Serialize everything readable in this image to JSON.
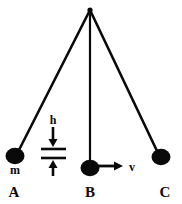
{
  "figure": {
    "background_color": "#ffffff",
    "ink_color": "#0a0a0a",
    "width": 182,
    "height": 204,
    "pivot": {
      "x": 90,
      "y": 10,
      "name": "pivot-point"
    },
    "positions": [
      {
        "id": "A",
        "label": "A",
        "label_x": 14,
        "label_y": 196,
        "bob": {
          "cx": 15,
          "cy": 156,
          "rx": 9,
          "ry": 8
        },
        "string": {
          "x1": 90,
          "y1": 10,
          "x2": 19,
          "y2": 150
        }
      },
      {
        "id": "B",
        "label": "B",
        "label_x": 90,
        "label_y": 196,
        "bob": {
          "cx": 90,
          "cy": 168,
          "rx": 9,
          "ry": 8
        },
        "string": {
          "x1": 90,
          "y1": 10,
          "x2": 90,
          "y2": 163
        }
      },
      {
        "id": "C",
        "label": "C",
        "label_x": 165,
        "label_y": 196,
        "bob": {
          "cx": 161,
          "cy": 157,
          "rx": 9,
          "ry": 8
        },
        "string": {
          "x1": 90,
          "y1": 10,
          "x2": 157,
          "y2": 151
        }
      }
    ],
    "annotations": {
      "mass_label": {
        "text": "m",
        "x": 15,
        "y": 174,
        "name": "mass-label"
      },
      "height_label": {
        "text": "h",
        "x": 53,
        "y": 124,
        "name": "height-label"
      },
      "velocity_label": {
        "text": "v",
        "x": 132,
        "y": 170,
        "name": "velocity-label"
      },
      "height_marker": {
        "name": "height-measure",
        "down_arrow": {
          "x": 53,
          "y1": 128,
          "y2": 146
        },
        "upper_bar": {
          "x1": 41,
          "x2": 66,
          "y": 148
        },
        "lower_bar": {
          "x1": 41,
          "x2": 66,
          "y": 157
        },
        "up_arrow": {
          "x": 53,
          "y1": 175,
          "y2": 157
        }
      },
      "velocity_arrow": {
        "name": "velocity-arrow",
        "x1": 97,
        "x2": 122,
        "y": 166
      }
    }
  }
}
